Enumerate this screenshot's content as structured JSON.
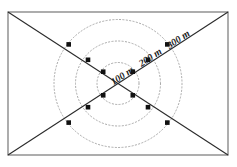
{
  "figure": {
    "title": "",
    "type": "survey-range-ring-diagram",
    "canvas": {
      "width": 237,
      "height": 167
    },
    "background_color": "#ffffff"
  },
  "frame": {
    "name": "plot-boundary-rectangle",
    "x": 8,
    "y": 12,
    "width": 220,
    "height": 143,
    "stroke_color": "#8a8a8a",
    "stroke_width": 1.4,
    "fill": "none"
  },
  "center": {
    "x": 118,
    "y": 83.5
  },
  "diagonals": {
    "stroke_color": "#2b2b2b",
    "stroke_width": 1.1,
    "lines": [
      {
        "name": "diagonal-top-left-to-bottom-right",
        "x1": 8,
        "y1": 12,
        "x2": 228,
        "y2": 155
      },
      {
        "name": "diagonal-bottom-left-to-top-right",
        "x1": 8,
        "y1": 155,
        "x2": 228,
        "y2": 12
      }
    ]
  },
  "rings": {
    "stroke_color": "#a8a8a8",
    "stroke_width": 1,
    "dash_pattern": "1.2 2.2",
    "items": [
      {
        "name": "range-ring-100m",
        "radius": 21,
        "label": "100 m"
      },
      {
        "name": "range-ring-200m",
        "radius": 42.5,
        "label": "200 m"
      },
      {
        "name": "range-ring-300m",
        "radius": 64,
        "label": "300 m"
      }
    ]
  },
  "station_markers": {
    "name": "station-marker",
    "shape": "square",
    "size": 4.6,
    "fill_color": "#111111",
    "count": 12,
    "points": [
      {
        "ring": "100 m",
        "x": 103.2,
        "y": 71.7
      },
      {
        "ring": "100 m",
        "x": 132.8,
        "y": 71.7
      },
      {
        "ring": "100 m",
        "x": 103.2,
        "y": 95.3
      },
      {
        "ring": "100 m",
        "x": 132.8,
        "y": 95.3
      },
      {
        "ring": "200 m",
        "x": 88.0,
        "y": 59.8
      },
      {
        "ring": "200 m",
        "x": 148.0,
        "y": 59.8
      },
      {
        "ring": "200 m",
        "x": 88.0,
        "y": 107.2
      },
      {
        "ring": "200 m",
        "x": 148.0,
        "y": 107.2
      },
      {
        "ring": "300 m",
        "x": 68.7,
        "y": 44.4
      },
      {
        "ring": "300 m",
        "x": 167.3,
        "y": 44.4
      },
      {
        "ring": "300 m",
        "x": 68.7,
        "y": 122.6
      },
      {
        "ring": "300 m",
        "x": 167.3,
        "y": 122.6
      }
    ]
  },
  "labels": {
    "rotation_degrees": -33,
    "items": [
      {
        "name": "range-label-100m",
        "text": "100 m",
        "x": 124,
        "y": 78.5
      },
      {
        "name": "range-label-200m",
        "text": "200 m",
        "x": 152,
        "y": 60
      },
      {
        "name": "range-label-300m",
        "text": "300 m",
        "x": 180,
        "y": 42
      }
    ]
  },
  "chart_data": {
    "type": "scatter",
    "title": "",
    "xlabel": "",
    "ylabel": "",
    "annotations": [
      "100 m",
      "200 m",
      "300 m"
    ],
    "categories": [
      "100 m",
      "200 m",
      "300 m"
    ],
    "series": [
      {
        "name": "Range rings (radius in metres)",
        "values": [
          100,
          200,
          300
        ]
      },
      {
        "name": "Station markers per ring",
        "values": [
          4,
          4,
          4
        ]
      }
    ],
    "legend_position": "none",
    "grid": false
  }
}
